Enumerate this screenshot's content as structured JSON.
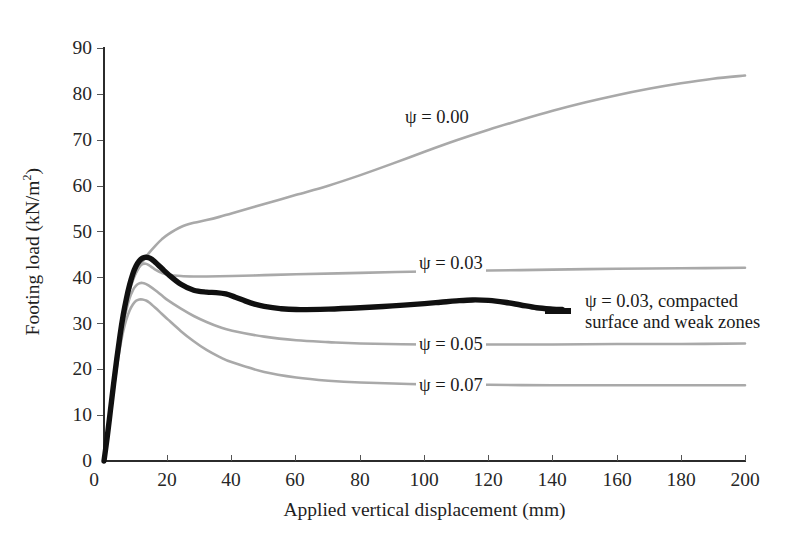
{
  "chart_data": {
    "type": "line",
    "title": "",
    "xlabel": "Applied vertical displacement (mm)",
    "ylabel": "Footing load (kN/m²)",
    "xlim": [
      0,
      200
    ],
    "ylim": [
      0,
      90
    ],
    "xticks": [
      "0",
      "20",
      "40",
      "60",
      "80",
      "100",
      "120",
      "140",
      "160",
      "180",
      "200"
    ],
    "yticks": [
      "0",
      "10",
      "20",
      "30",
      "40",
      "50",
      "60",
      "70",
      "80",
      "90"
    ],
    "grid": false,
    "legend_position": "inline-curve-labels",
    "series": [
      {
        "name": "ψ = 0.00",
        "color": "#a9a9a9",
        "x": [
          0,
          1,
          2,
          3,
          4,
          5,
          6,
          7,
          8,
          9,
          10,
          12,
          14,
          16,
          18,
          20,
          24,
          28,
          32,
          36,
          40,
          50,
          60,
          70,
          80,
          90,
          100,
          110,
          120,
          130,
          140,
          150,
          160,
          170,
          180,
          190,
          200
        ],
        "y": [
          0,
          5.0,
          10.5,
          16.0,
          21.5,
          26.5,
          31.0,
          34.5,
          37.3,
          39.3,
          41.0,
          43.4,
          45.3,
          46.9,
          48.3,
          49.4,
          51.0,
          51.9,
          52.5,
          53.2,
          54.0,
          56.0,
          58.0,
          60.0,
          62.3,
          64.8,
          67.4,
          69.9,
          72.2,
          74.3,
          76.3,
          78.1,
          79.7,
          81.1,
          82.3,
          83.3,
          84.0
        ]
      },
      {
        "name": "ψ = 0.03",
        "color": "#a9a9a9",
        "x": [
          0,
          1,
          2,
          3,
          4,
          5,
          6,
          7,
          8,
          9,
          10,
          11,
          12,
          13,
          14,
          15,
          16,
          18,
          20,
          24,
          28,
          32,
          40,
          50,
          60,
          80,
          100,
          120,
          140,
          160,
          180,
          200
        ],
        "y": [
          0,
          5.0,
          10.5,
          16.0,
          21.5,
          26.5,
          31.0,
          34.5,
          37.4,
          39.6,
          41.2,
          42.3,
          42.9,
          43.0,
          42.7,
          42.2,
          41.7,
          41.0,
          40.6,
          40.3,
          40.2,
          40.2,
          40.3,
          40.5,
          40.7,
          41.0,
          41.3,
          41.5,
          41.7,
          41.9,
          42.0,
          42.1
        ]
      },
      {
        "name": "ψ = 0.05",
        "color": "#a9a9a9",
        "x": [
          0,
          1,
          2,
          3,
          4,
          5,
          6,
          7,
          8,
          9,
          10,
          11,
          12,
          13,
          14,
          16,
          18,
          20,
          24,
          28,
          32,
          36,
          40,
          50,
          60,
          70,
          80,
          100,
          120,
          140,
          160,
          180,
          200
        ],
        "y": [
          0,
          5.0,
          10.5,
          16.0,
          21.3,
          26.0,
          30.0,
          33.0,
          35.5,
          37.2,
          38.2,
          38.7,
          38.8,
          38.6,
          38.2,
          37.2,
          36.1,
          35.0,
          33.2,
          31.6,
          30.3,
          29.2,
          28.4,
          27.1,
          26.3,
          25.9,
          25.6,
          25.4,
          25.4,
          25.4,
          25.5,
          25.5,
          25.6
        ]
      },
      {
        "name": "ψ = 0.07",
        "color": "#a9a9a9",
        "x": [
          0,
          1,
          2,
          3,
          4,
          5,
          6,
          7,
          8,
          9,
          10,
          11,
          12,
          13,
          14,
          16,
          18,
          20,
          24,
          28,
          32,
          36,
          40,
          50,
          60,
          70,
          80,
          100,
          120,
          140,
          160,
          180,
          200
        ],
        "y": [
          0,
          5.0,
          10.3,
          15.5,
          20.4,
          24.8,
          28.3,
          30.9,
          32.8,
          34.1,
          34.9,
          35.2,
          35.2,
          35.0,
          34.6,
          33.4,
          32.1,
          30.8,
          28.3,
          26.1,
          24.2,
          22.7,
          21.5,
          19.4,
          18.2,
          17.5,
          17.1,
          16.7,
          16.6,
          16.5,
          16.5,
          16.5,
          16.5
        ]
      },
      {
        "name": "ψ = 0.03, compacted surface and weak zones",
        "color": "#101010",
        "x": [
          0,
          1,
          2,
          3,
          4,
          5,
          6,
          7,
          8,
          9,
          10,
          11,
          12,
          13,
          14,
          15,
          16,
          18,
          20,
          24,
          28,
          32,
          35,
          38,
          41,
          44,
          47,
          50,
          55,
          60,
          70,
          80,
          90,
          100,
          105,
          110,
          115,
          120,
          125,
          130,
          135,
          140,
          143
        ],
        "y": [
          0,
          5.2,
          11.0,
          16.8,
          22.3,
          27.4,
          31.8,
          35.4,
          38.4,
          40.8,
          42.5,
          43.6,
          44.2,
          44.4,
          44.3,
          43.9,
          43.3,
          42.0,
          40.7,
          38.5,
          37.2,
          36.8,
          36.7,
          36.4,
          35.7,
          34.9,
          34.2,
          33.7,
          33.2,
          33.0,
          33.1,
          33.4,
          33.8,
          34.3,
          34.6,
          34.9,
          35.1,
          35.0,
          34.6,
          34.0,
          33.4,
          33.1,
          33.0
        ]
      }
    ],
    "annotations": [
      {
        "name": "psi-000-label",
        "text": "ψ = 0.00",
        "x_mm": 100,
        "y_kn": 70
      },
      {
        "name": "psi-003-label",
        "text": "ψ = 0.03",
        "x_mm": 104,
        "y_kn": 41.8
      },
      {
        "name": "psi-005-label",
        "text": "ψ = 0.05",
        "x_mm": 104,
        "y_kn": 25.3
      },
      {
        "name": "psi-007-label",
        "text": "ψ = 0.07",
        "x_mm": 104,
        "y_kn": 16.3
      },
      {
        "name": "psi-003-compacted-label",
        "text": "ψ = 0.03, compacted surface and weak zones",
        "x_mm": 146,
        "y_kn": 33.2
      }
    ]
  },
  "figure": {
    "psi_symbol": "ψ",
    "axis_color": "#2b2b2b",
    "curve_gray": "#a9a9a9",
    "curve_black": "#101010",
    "background": "#ffffff"
  }
}
